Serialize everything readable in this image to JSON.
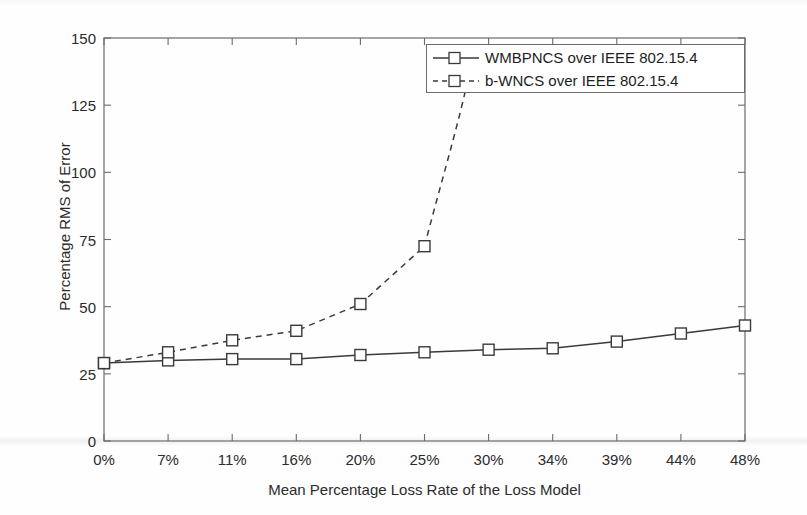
{
  "chart_data": {
    "type": "line",
    "title": "",
    "xlabel": "Mean Percentage Loss Rate of the Loss Model",
    "ylabel": "Percentage RMS of Error",
    "categories": [
      "0%",
      "7%",
      "11%",
      "16%",
      "20%",
      "25%",
      "30%",
      "34%",
      "39%",
      "44%",
      "48%"
    ],
    "x_tick_labels": [
      "0%",
      "7%",
      "11%",
      "16%",
      "20%",
      "25%",
      "30%",
      "34%",
      "39%",
      "44%",
      "48%"
    ],
    "y_tick_labels": [
      "0",
      "25",
      "50",
      "75",
      "100",
      "125",
      "150"
    ],
    "y_ticks": [
      0,
      25,
      50,
      75,
      100,
      125,
      150
    ],
    "ylim": [
      0,
      150
    ],
    "xlim": [
      0,
      10
    ],
    "grid": false,
    "legend_position": "top-right",
    "series": [
      {
        "name": "WMBPNCS over IEEE 802.15.4",
        "style": "solid",
        "marker": "square",
        "color": "#3a3a3a",
        "values": [
          29,
          30,
          30.5,
          30.5,
          32,
          33,
          34,
          34.5,
          37,
          40,
          43
        ]
      },
      {
        "name": "b-WNCS over IEEE 802.15.4",
        "style": "dashed",
        "marker": "square",
        "color": "#3a3a3a",
        "values": [
          29,
          33,
          37.5,
          41,
          51,
          72.5,
          null,
          null,
          null,
          null,
          null
        ],
        "note": "rises off the top of the chart after 25%"
      }
    ]
  },
  "legend": {
    "entries": [
      {
        "label": "WMBPNCS over IEEE 802.15.4",
        "style": "solid"
      },
      {
        "label": "b-WNCS over IEEE 802.15.4",
        "style": "dashed"
      }
    ]
  },
  "axes": {
    "y_label": "Percentage RMS of Error",
    "x_label": "Mean Percentage Loss Rate of the Loss Model"
  },
  "colors": {
    "line": "#3a3a3a",
    "axis": "#6b6b6b",
    "text": "#2c2c2c",
    "background": "#fefefe"
  }
}
